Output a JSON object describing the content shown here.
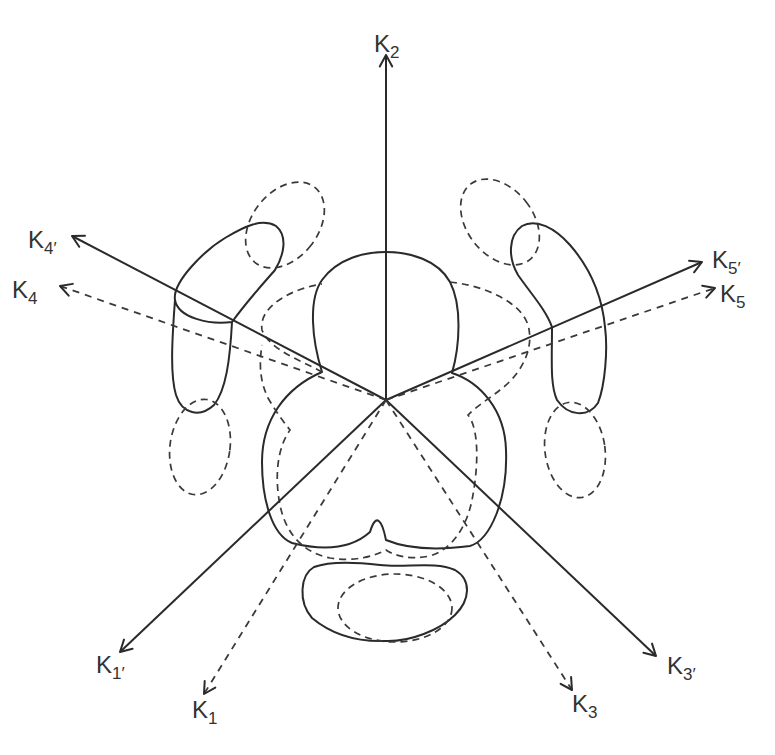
{
  "figure": {
    "center": [
      386,
      400
    ],
    "colors": {
      "ink": "#2a2a2a",
      "background": "#ffffff"
    }
  },
  "axes": [
    {
      "id": "K2",
      "label": "K",
      "sub": "2",
      "style": "solid",
      "end": [
        386,
        55
      ],
      "label_pos": [
        374,
        32
      ]
    },
    {
      "id": "K4p",
      "label": "K",
      "sub": "4′",
      "style": "solid",
      "end": [
        72,
        236
      ],
      "label_pos": [
        28,
        228
      ]
    },
    {
      "id": "K4",
      "label": "K",
      "sub": "4",
      "style": "dashed",
      "end": [
        60,
        286
      ],
      "label_pos": [
        12,
        278
      ]
    },
    {
      "id": "K5p",
      "label": "K",
      "sub": "5′",
      "style": "solid",
      "end": [
        702,
        262
      ],
      "label_pos": [
        712,
        248
      ]
    },
    {
      "id": "K5",
      "label": "K",
      "sub": "5",
      "style": "dashed",
      "end": [
        715,
        288
      ],
      "label_pos": [
        720,
        282
      ]
    },
    {
      "id": "K1p",
      "label": "K",
      "sub": "1′",
      "style": "solid",
      "end": [
        120,
        652
      ],
      "label_pos": [
        96,
        653
      ]
    },
    {
      "id": "K1",
      "label": "K",
      "sub": "1",
      "style": "dashed",
      "end": [
        204,
        694
      ],
      "label_pos": [
        192,
        698
      ]
    },
    {
      "id": "K3p",
      "label": "K",
      "sub": "3′",
      "style": "solid",
      "end": [
        656,
        656
      ],
      "label_pos": [
        667,
        654
      ]
    },
    {
      "id": "K3",
      "label": "K",
      "sub": "3",
      "style": "dashed",
      "end": [
        572,
        690
      ],
      "label_pos": [
        572,
        692
      ]
    }
  ],
  "shapes": {
    "solid": [
      {
        "name": "central-clover-contour",
        "d": "M322,372 C312,340 308,300 322,280 C338,258 365,252 386,252 C410,252 438,260 450,282 C462,305 460,345 452,373 C480,382 505,410 506,450 C508,500 490,540 470,546 C440,550 410,550 386,540 C382,520 376,512 370,532 C350,550 320,550 292,543 C272,535 262,500 262,462 C262,420 285,388 322,372 Z"
      },
      {
        "name": "left-upper-lobe",
        "d": "M232,322 C210,325 178,318 175,300 C172,282 205,250 225,238 C245,226 262,218 276,226 C288,236 284,255 275,270 C262,285 248,300 232,322 Z M232,322 C230,360 226,390 214,405 C200,418 182,414 176,395 C170,375 172,340 175,300"
      },
      {
        "name": "right-upper-lobe",
        "d": "M552,327 C546,310 532,295 518,275 C508,258 508,236 522,226 C536,218 555,228 570,245 C590,268 602,295 605,327 C608,350 605,385 598,403 C588,418 568,416 557,400 C550,385 552,360 552,327 Z"
      },
      {
        "name": "bottom-kidney",
        "d": "M314,567 C330,561 355,562 380,565 C405,568 435,561 455,570 C472,580 470,600 455,615 C440,630 410,642 385,641 C355,642 330,633 312,618 C298,602 300,575 314,567 Z"
      }
    ],
    "dashed": [
      {
        "name": "central-pentagon-dashed",
        "d": "M322,372 C300,360 270,350 262,330 C258,305 295,288 322,284 M450,282 C480,285 520,300 528,325 C535,350 520,375 500,390 C490,398 478,405 468,415 C480,430 478,470 472,500 C466,530 450,550 430,556 C410,560 395,556 386,550 C375,556 355,562 330,558 C300,552 285,530 280,505 C275,480 276,450 290,430 C282,420 275,410 268,398 C262,385 258,370 262,345"
      },
      {
        "name": "left-top-dashed-ellipse",
        "cx": 285,
        "cy": 225,
        "rx": 33,
        "ry": 48,
        "rotate": 38
      },
      {
        "name": "left-bottom-dashed-ellipse",
        "cx": 200,
        "cy": 447,
        "rx": 30,
        "ry": 48,
        "rotate": 8
      },
      {
        "name": "right-top-dashed-ellipse",
        "cx": 500,
        "cy": 222,
        "rx": 33,
        "ry": 48,
        "rotate": -38
      },
      {
        "name": "right-bottom-dashed-ellipse",
        "cx": 575,
        "cy": 450,
        "rx": 30,
        "ry": 48,
        "rotate": -8
      },
      {
        "name": "bottom-inner-dashed-ellipse",
        "cx": 395,
        "cy": 608,
        "rx": 57,
        "ry": 34,
        "rotate": 0
      }
    ]
  }
}
